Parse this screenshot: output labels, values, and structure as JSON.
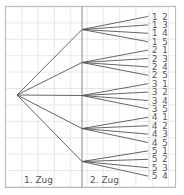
{
  "diagram": {
    "type": "tree",
    "labels": {
      "level1": "1. Zug",
      "level2": "2. Zug"
    },
    "colors": {
      "line": "#555555",
      "grid": "#e2e2e2",
      "frame": "#bdbdbd",
      "text": "#555555"
    },
    "level1_nodes": [
      "1",
      "2",
      "3",
      "4",
      "5"
    ],
    "leaves": [
      "1 2",
      "1 3",
      "1 4",
      "1 5",
      "2 1",
      "2 3",
      "2 4",
      "2 5",
      "3 1",
      "3 2",
      "3 4",
      "3 5",
      "4 1",
      "4 2",
      "4 3",
      "4 5",
      "5 1",
      "5 2",
      "5 3",
      "5 4"
    ]
  }
}
